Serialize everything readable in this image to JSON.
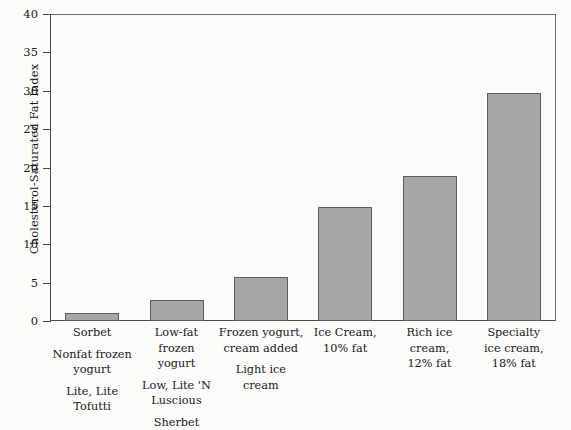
{
  "chart_data": {
    "type": "bar",
    "title": "",
    "xlabel": "",
    "ylabel": "Cholesterol-Saturated Fat Index",
    "ylim": [
      0,
      40
    ],
    "ytick_step": 5,
    "yticks": [
      0,
      5,
      10,
      15,
      20,
      25,
      30,
      35,
      40
    ],
    "ytick_labels": [
      "0",
      "5",
      "10",
      "15",
      "20",
      "25",
      "30",
      "35",
      "40"
    ],
    "grid": false,
    "legend": null,
    "categories": [
      "Sorbet",
      "Low-fat frozen yogurt",
      "Frozen yogurt, cream added",
      "Ice Cream, 10% fat",
      "Rich ice cream, 12% fat",
      "Specialty ice cream, 18% fat"
    ],
    "values": [
      1.0,
      2.7,
      5.7,
      14.8,
      18.9,
      29.7
    ],
    "bar_color": "#a6a6a6",
    "bar_edge_color": "#5e5e5e",
    "axis_color": "#4a4a4a",
    "frame_color": "#6e6e6e",
    "background_color": "#fbfbfa",
    "text_color": "#1a1a1a"
  },
  "axis": {
    "y_title": "Cholesterol-Saturated Fat Index"
  },
  "category_labels": [
    {
      "groups": [
        [
          "Sorbet"
        ],
        [
          "Nonfat frozen",
          "yogurt"
        ],
        [
          "Lite, Lite",
          "Tofutti"
        ]
      ]
    },
    {
      "groups": [
        [
          "Low-fat",
          "frozen",
          "yogurt"
        ],
        [
          "Low, Lite 'N",
          "Luscious"
        ],
        [
          "Sherbet"
        ]
      ]
    },
    {
      "groups": [
        [
          "Frozen yogurt,",
          "cream added"
        ],
        [
          "Light ice",
          "cream"
        ]
      ]
    },
    {
      "groups": [
        [
          "Ice Cream,",
          "10% fat"
        ]
      ]
    },
    {
      "groups": [
        [
          "Rich ice",
          "cream,",
          "12% fat"
        ]
      ]
    },
    {
      "groups": [
        [
          "Specialty",
          "ice cream,",
          "18% fat"
        ]
      ]
    }
  ]
}
